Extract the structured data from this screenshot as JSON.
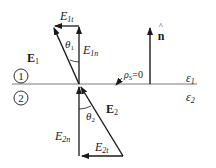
{
  "diagram": {
    "regions": [
      {
        "id": "1",
        "label": "1",
        "permittivity": "ε",
        "permittivity_sub": "1"
      },
      {
        "id": "2",
        "label": "2",
        "permittivity": "ε",
        "permittivity_sub": "2"
      }
    ],
    "surface_charge": {
      "symbol": "ρ",
      "sub": "S",
      "value": "=0"
    },
    "normal": {
      "symbol": "n",
      "hat": "^"
    },
    "vectors": {
      "E1": {
        "label": "E",
        "sub": "1"
      },
      "E1n": {
        "label": "E",
        "sub": "1n"
      },
      "E1t": {
        "label": "E",
        "sub": "1t"
      },
      "E2": {
        "label": "E",
        "sub": "2"
      },
      "E2n": {
        "label": "E",
        "sub": "2n"
      },
      "E2t": {
        "label": "E",
        "sub": "2t"
      }
    },
    "angles": {
      "theta1": {
        "symbol": "θ",
        "sub": "1"
      },
      "theta2": {
        "symbol": "θ",
        "sub": "2"
      }
    },
    "colors": {
      "line": "#1a1a1a",
      "interface": "#7a7a7a",
      "background": "#ffffff"
    }
  }
}
